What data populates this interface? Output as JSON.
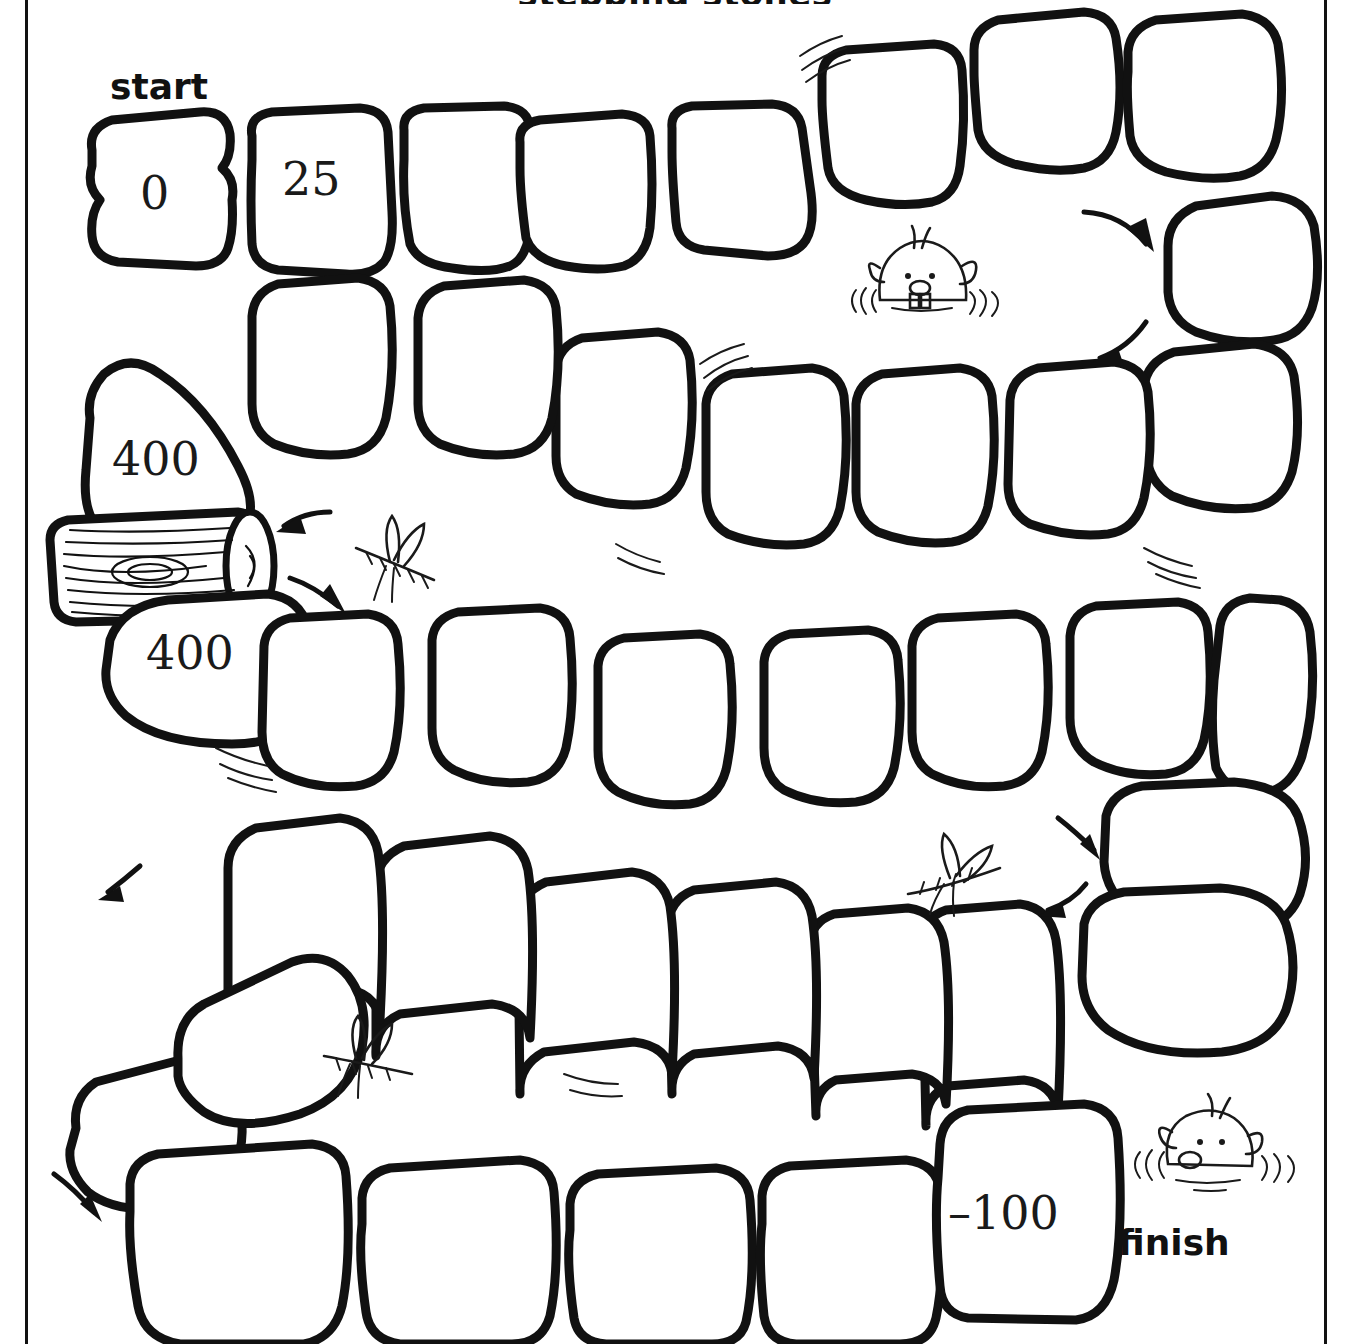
{
  "page": {
    "title_partial": "stepping stones",
    "background_color": "#ffffff",
    "ink_color": "#111111"
  },
  "markers": {
    "start_label": "start",
    "finish_label": "finish"
  },
  "board": {
    "description": "Hand-drawn stepping-stone number path board game",
    "rows": [
      {
        "row": 1,
        "direction": "left-to-right",
        "stones": [
          {
            "id": "s1",
            "label": "0"
          },
          {
            "id": "s2",
            "label": "25"
          },
          {
            "id": "s3",
            "label": ""
          },
          {
            "id": "s4",
            "label": ""
          },
          {
            "id": "s5",
            "label": ""
          },
          {
            "id": "s6",
            "label": ""
          },
          {
            "id": "s7",
            "label": ""
          },
          {
            "id": "s8",
            "label": ""
          }
        ]
      },
      {
        "row": 2,
        "direction": "right-to-left",
        "stones": [
          {
            "id": "s9",
            "label": ""
          },
          {
            "id": "s10",
            "label": ""
          },
          {
            "id": "s11",
            "label": ""
          },
          {
            "id": "s12",
            "label": ""
          },
          {
            "id": "s13",
            "label": ""
          },
          {
            "id": "s14",
            "label": ""
          },
          {
            "id": "s15",
            "label": ""
          },
          {
            "id": "s16",
            "label": ""
          },
          {
            "id": "s17",
            "label": "400"
          }
        ]
      },
      {
        "row": 3,
        "direction": "left-to-right",
        "stones": [
          {
            "id": "s18",
            "label": "400"
          },
          {
            "id": "s19",
            "label": ""
          },
          {
            "id": "s20",
            "label": ""
          },
          {
            "id": "s21",
            "label": ""
          },
          {
            "id": "s22",
            "label": ""
          },
          {
            "id": "s23",
            "label": ""
          },
          {
            "id": "s24",
            "label": ""
          },
          {
            "id": "s25",
            "label": ""
          },
          {
            "id": "s26",
            "label": ""
          }
        ]
      },
      {
        "row": 4,
        "direction": "right-to-left",
        "stones": [
          {
            "id": "s27",
            "label": ""
          },
          {
            "id": "s28",
            "label": ""
          },
          {
            "id": "s29",
            "label": ""
          },
          {
            "id": "s30",
            "label": ""
          },
          {
            "id": "s31",
            "label": ""
          },
          {
            "id": "s32",
            "label": ""
          },
          {
            "id": "s33",
            "label": ""
          },
          {
            "id": "s34",
            "label": ""
          }
        ]
      },
      {
        "row": 5,
        "direction": "left-to-right",
        "stones": [
          {
            "id": "s35",
            "label": ""
          },
          {
            "id": "s36",
            "label": ""
          },
          {
            "id": "s37",
            "label": ""
          },
          {
            "id": "s38",
            "label": ""
          },
          {
            "id": "s39",
            "label": "-100"
          }
        ]
      }
    ],
    "labels": {
      "stone_0": "0",
      "stone_25": "25",
      "stone_400_upper": "400",
      "stone_400_lower": "400",
      "stone_minus_100": "–100"
    }
  },
  "decorations": {
    "log": {
      "name": "wooden-log",
      "count": 1
    },
    "beavers": {
      "name": "beaver-head",
      "count": 2
    },
    "dragonflies": {
      "name": "dragonfly",
      "count": 3
    },
    "ripples": {
      "name": "water-ripple",
      "count": 6
    },
    "arrows": {
      "name": "direction-arrow",
      "count": 6
    }
  }
}
